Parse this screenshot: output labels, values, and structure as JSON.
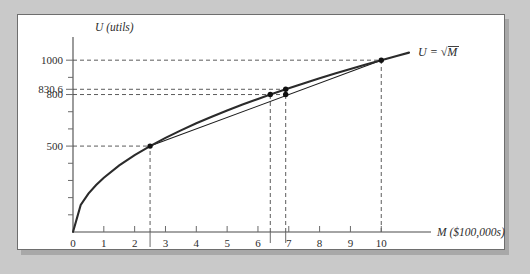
{
  "figure": {
    "panel_background": "#ffffff",
    "page_background": "#c9c9c9",
    "border_color": "#6e6e6e"
  },
  "chart_data": {
    "type": "line",
    "title": "",
    "xlabel": "M ($100,000s)",
    "ylabel": "U (utils)",
    "xlim": [
      0,
      10.9
    ],
    "ylim": [
      0,
      1100
    ],
    "grid": false,
    "legend": "none",
    "curve_label": "U = √M",
    "curve_label_parts": {
      "lhs": "U =",
      "radical": "√",
      "radicand": "M"
    },
    "series": [
      {
        "name": "utility-curve",
        "type": "curve",
        "equation": "U = 100*sqrt(10*M)",
        "color": "#2b2b2b",
        "x": [
          0,
          0.25,
          0.5,
          0.75,
          1,
          1.5,
          2,
          2.5,
          3,
          3.5,
          4,
          4.5,
          5,
          5.5,
          6,
          6.4,
          6.5,
          6.9,
          7,
          7.5,
          8,
          8.5,
          9,
          9.5,
          10,
          10.5,
          10.9
        ],
        "y": [
          0,
          158.1,
          223.6,
          273.9,
          316.2,
          387.3,
          447.2,
          500,
          547.7,
          591.6,
          632.5,
          670.8,
          707.1,
          741.6,
          774.6,
          800,
          806.2,
          830.7,
          836.7,
          866,
          894.4,
          921.9,
          948.7,
          974.7,
          1000,
          1024.7,
          1044
        ]
      },
      {
        "name": "chord-line",
        "type": "line",
        "color": "#1c1c1c",
        "x": [
          2.5,
          10
        ],
        "y": [
          500,
          1000
        ]
      }
    ],
    "points": [
      {
        "name": "point-2.5-500",
        "x": 2.5,
        "y": 500,
        "on": "curve"
      },
      {
        "name": "point-6.4-800",
        "x": 6.4,
        "y": 800,
        "on": "curve"
      },
      {
        "name": "point-6.9-830.6",
        "x": 6.9,
        "y": 830.6,
        "on": "curve"
      },
      {
        "name": "point-6.9-800",
        "x": 6.9,
        "y": 800,
        "on": "chord"
      },
      {
        "name": "point-10-1000",
        "x": 10,
        "y": 1000,
        "on": "both"
      }
    ],
    "x_ticks": [
      {
        "value": 0,
        "label": "0",
        "row": "main"
      },
      {
        "value": 1,
        "label": "1",
        "row": "main"
      },
      {
        "value": 2,
        "label": "2",
        "row": "main"
      },
      {
        "value": 3,
        "label": "3",
        "row": "main"
      },
      {
        "value": 4,
        "label": "4",
        "row": "main"
      },
      {
        "value": 5,
        "label": "5",
        "row": "main"
      },
      {
        "value": 6,
        "label": "6",
        "row": "main"
      },
      {
        "value": 7,
        "label": "7",
        "row": "main"
      },
      {
        "value": 8,
        "label": "8",
        "row": "main"
      },
      {
        "value": 9,
        "label": "9",
        "row": "main"
      },
      {
        "value": 10,
        "label": "10",
        "row": "main"
      }
    ],
    "x_callouts": [
      {
        "value": 2.5,
        "label": "2.5"
      },
      {
        "value": 6.4,
        "label": "6.4"
      },
      {
        "value": 6.9,
        "label": "6.9"
      }
    ],
    "y_ticks_major": [
      {
        "value": 500,
        "label": "500"
      },
      {
        "value": 800,
        "label": "800"
      },
      {
        "value": 830.6,
        "label": "830.6"
      },
      {
        "value": 1000,
        "label": "1000"
      }
    ],
    "y_ticks_minor": [
      100,
      200,
      300,
      400,
      600,
      700,
      900
    ],
    "guidelines": [
      {
        "name": "guide-h-1000",
        "orient": "horizontal",
        "y": 1000,
        "from_x": 0,
        "to_x": 10
      },
      {
        "name": "guide-h-830.6",
        "orient": "horizontal",
        "y": 830.6,
        "from_x": 0,
        "to_x": 6.9
      },
      {
        "name": "guide-h-800",
        "orient": "horizontal",
        "y": 800,
        "from_x": 0,
        "to_x": 6.9
      },
      {
        "name": "guide-h-500",
        "orient": "horizontal",
        "y": 500,
        "from_x": 0,
        "to_x": 2.5
      },
      {
        "name": "guide-v-2.5",
        "orient": "vertical",
        "x": 2.5,
        "from_y": 0,
        "to_y": 500
      },
      {
        "name": "guide-v-6.4",
        "orient": "vertical",
        "x": 6.4,
        "from_y": 0,
        "to_y": 800
      },
      {
        "name": "guide-v-6.9",
        "orient": "vertical",
        "x": 6.9,
        "from_y": 0,
        "to_y": 830.6
      },
      {
        "name": "guide-v-10",
        "orient": "vertical",
        "x": 10,
        "from_y": 0,
        "to_y": 1000
      }
    ]
  }
}
